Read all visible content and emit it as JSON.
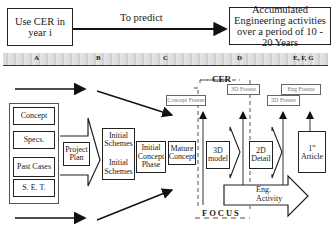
{
  "header": {
    "start_box": "Use CER in year i",
    "connector_label": "To predict",
    "end_box": "Accumulated Engineering activities over a period of 10 - 20 Years"
  },
  "phase_band": {
    "labels": [
      "A",
      "B",
      "C",
      "D",
      "E, F, G"
    ]
  },
  "inputs": {
    "items": [
      "Concept",
      "Specs.",
      "Past Cases",
      "S. E. T."
    ]
  },
  "flow": {
    "project_plan": "Project Plan",
    "initial_schemes_1": "Initial Schemes",
    "initial_schemes_2": "Initial Schemes",
    "initial_concept_phase": "Initial Concept Phase",
    "mature_concept": "Mature Concept",
    "model_3d": "3D model",
    "detail_2d": "2D Detail",
    "first_article": "1st Article",
    "first_article_line1": "1",
    "first_article_sup": "st",
    "first_article_line2": "Article",
    "eng_activity": "Eng. Activity"
  },
  "milestones": {
    "cer_label": "CER",
    "focus_label": "FOCUS",
    "concept_freeze": "Concept Freeze",
    "freeze_3d": "3D Freeze",
    "freeze_2d": "2D Freeze",
    "eng_freeze": "Eng Freeze"
  }
}
